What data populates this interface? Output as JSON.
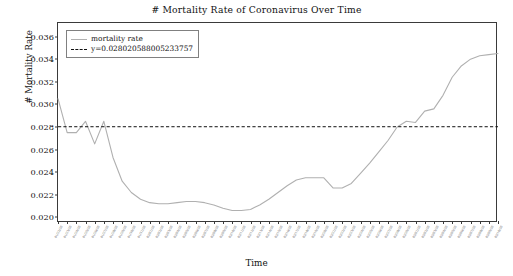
{
  "chart_data": {
    "type": "line",
    "title": "# Mortality Rate of Coronavirus Over Time",
    "xlabel": "Time",
    "ylabel": "# Mortality Rate",
    "ylim": [
      0.0195,
      0.0372
    ],
    "yticks": [
      "0.020",
      "0.022",
      "0.024",
      "0.026",
      "0.028",
      "0.030",
      "0.032",
      "0.034",
      "0.036"
    ],
    "ytick_values": [
      0.02,
      0.022,
      0.024,
      0.026,
      0.028,
      0.03,
      0.032,
      0.034,
      0.036
    ],
    "grid": false,
    "legend_position": "upper left",
    "legend": [
      {
        "label": "mortality rate",
        "style": "solid",
        "color": "#b0b0b0"
      },
      {
        "label": "y=0.028020588005233757",
        "style": "dashed",
        "color": "#111111"
      }
    ],
    "threshold": {
      "label": "y=0.028020588005233757",
      "value": 0.028020588005233757
    },
    "categories": [
      "01/22/20",
      "01/23/20",
      "01/24/20",
      "01/25/20",
      "01/26/20",
      "01/27/20",
      "01/28/20",
      "01/29/20",
      "01/30/20",
      "01/31/20",
      "02/01/20",
      "02/02/20",
      "02/03/20",
      "02/04/20",
      "02/05/20",
      "02/06/20",
      "02/07/20",
      "02/08/20",
      "02/09/20",
      "02/10/20",
      "02/11/20",
      "02/12/20",
      "02/13/20",
      "02/14/20",
      "02/15/20",
      "02/16/20",
      "02/17/20",
      "02/18/20",
      "02/19/20",
      "02/20/20",
      "02/21/20",
      "02/22/20",
      "02/23/20",
      "02/24/20",
      "02/25/20",
      "02/26/20",
      "02/27/20",
      "02/28/20",
      "02/29/20",
      "03/01/20",
      "03/02/20",
      "03/03/20",
      "03/04/20",
      "03/05/20",
      "03/06/20",
      "03/07/20",
      "03/08/20",
      "03/09/20",
      "03/10/20"
    ],
    "series": [
      {
        "name": "mortality rate",
        "color": "#b0b0b0",
        "values": [
          0.0305,
          0.0275,
          0.0275,
          0.0285,
          0.0265,
          0.0285,
          0.0253,
          0.0232,
          0.0222,
          0.0216,
          0.0213,
          0.0212,
          0.0212,
          0.0213,
          0.0214,
          0.0214,
          0.0213,
          0.0211,
          0.0208,
          0.0206,
          0.0206,
          0.0207,
          0.0211,
          0.0216,
          0.0222,
          0.0228,
          0.0233,
          0.0235,
          0.0235,
          0.0235,
          0.0226,
          0.0226,
          0.023,
          0.0239,
          0.0248,
          0.0258,
          0.0268,
          0.028,
          0.0285,
          0.0284,
          0.0294,
          0.0296,
          0.0308,
          0.0324,
          0.0334,
          0.034,
          0.0343,
          0.0344,
          0.0345
        ]
      }
    ],
    "annotations": {
      "series_note": "Curve starts near 0.0305, oscillates about the 0.02802 threshold, falls to a trough near 0.0205 mid-series, rises with a bump near 0.0235, then climbs steeply past the threshold to a plateau near 0.0345 and a final rise to about 0.0367."
    }
  }
}
